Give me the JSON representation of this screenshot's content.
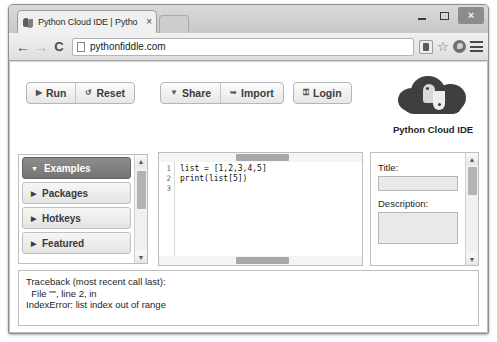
{
  "browser": {
    "tab": {
      "title": "Python Cloud IDE | Pytho",
      "close_label": "×",
      "favicon_name": "python-favicon"
    },
    "window_controls": {
      "minimize_label": "—",
      "maximize_label": "□",
      "close_label": "×"
    },
    "nav": {
      "back_label": "←",
      "forward_label": "→",
      "reload_label": "C",
      "url": "pythonfiddle.com"
    },
    "actions": {
      "extension_label": "extension-icon",
      "bookmark_label": "☆",
      "profile_label": "profile-icon",
      "menu_label": "menu-icon"
    }
  },
  "app": {
    "toolbar": {
      "run_label": "Run",
      "run_icon": "▶",
      "reset_label": "Reset",
      "reset_icon": "↺",
      "share_label": "Share",
      "share_icon": "▼",
      "import_label": "Import",
      "import_icon": "➥",
      "login_label": "Login",
      "login_icon": "⚿"
    },
    "social": {
      "plusone_g": "g",
      "plusone_label": "+1",
      "count": "1.6k"
    },
    "brand": {
      "label": "Python Cloud IDE",
      "logo_name": "python-cloud-logo"
    }
  },
  "sidebar": {
    "items": [
      {
        "label": "Examples",
        "expanded": true,
        "caret": "▼"
      },
      {
        "label": "Packages",
        "expanded": false,
        "caret": "▶"
      },
      {
        "label": "Hotkeys",
        "expanded": false,
        "caret": "▶"
      },
      {
        "label": "Featured",
        "expanded": false,
        "caret": "▶"
      }
    ],
    "scroll_up": "▲",
    "scroll_down": "▼"
  },
  "editor": {
    "line_numbers": "1\n2\n3",
    "code": "list = [1,2,3,4,5]\nprint(list[5])"
  },
  "details_panel": {
    "title_label": "Title:",
    "title_value": "",
    "description_label": "Description:",
    "description_value": "",
    "scroll_up": "▲",
    "scroll_down": "▼"
  },
  "console": {
    "lines": [
      "Traceback (most recent call last):",
      "  File \"\", line 2, in",
      "IndexError: list index out of range"
    ]
  },
  "colors": {
    "window_chrome": "#d4d4d4",
    "page_bg": "#ffffff",
    "active_sidebar": "#7b7b7b",
    "logo_dark": "#3f3f3f",
    "text": "#262626"
  }
}
